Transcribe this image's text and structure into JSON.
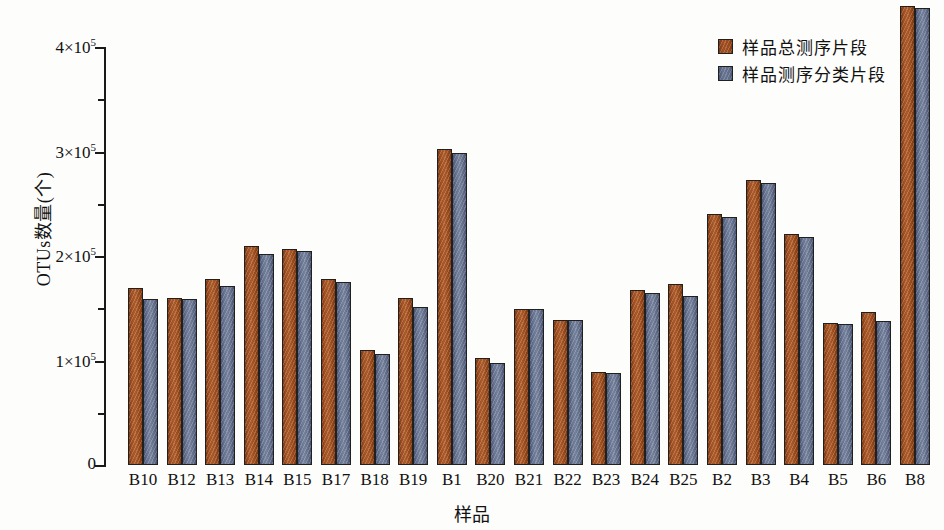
{
  "chart_data": {
    "type": "bar",
    "title": "",
    "xlabel": "样品",
    "ylabel": "OTUs数量(个)",
    "ylim": [
      0,
      440000
    ],
    "yticks": [
      0,
      100000,
      200000,
      300000,
      400000
    ],
    "ytick_labels": [
      "0",
      "1×10⁵",
      "2×10⁵",
      "3×10⁵",
      "4×10⁵"
    ],
    "ytick_mantissas": [
      "0",
      "1",
      "2",
      "3",
      "4"
    ],
    "ytick_base": "×10",
    "ytick_exponent": "5",
    "minor_ticks": [
      50000,
      150000,
      250000,
      350000
    ],
    "grid": false,
    "legend_position": "top-right",
    "categories": [
      "B10",
      "B12",
      "B13",
      "B14",
      "B15",
      "B17",
      "B18",
      "B19",
      "B1",
      "B20",
      "B21",
      "B22",
      "B23",
      "B24",
      "B25",
      "B2",
      "B3",
      "B4",
      "B5",
      "B6",
      "B8"
    ],
    "series": [
      {
        "name": "样品总测序片段",
        "color": "#a85324",
        "values": [
          168000,
          159000,
          177000,
          209000,
          206000,
          177000,
          109000,
          159000,
          301000,
          101000,
          148000,
          138000,
          88000,
          167000,
          172000,
          239000,
          272000,
          220000,
          135000,
          145000,
          438000
        ]
      },
      {
        "name": "样品测序分类片段",
        "color": "#6d7a97",
        "values": [
          158000,
          158000,
          170000,
          201000,
          204000,
          174000,
          105000,
          150000,
          298000,
          97000,
          148000,
          138000,
          87000,
          164000,
          161000,
          236000,
          269000,
          217000,
          134000,
          137000,
          436000
        ]
      }
    ]
  },
  "legend": {
    "items": [
      {
        "label": "样品总测序片段"
      },
      {
        "label": "样品测序分类片段"
      }
    ]
  }
}
